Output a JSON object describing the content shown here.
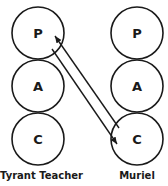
{
  "diagram": {
    "type": "transactional-analysis",
    "states": [
      "P",
      "A",
      "C"
    ],
    "persons": [
      {
        "name": "Tyrant Teacher",
        "states": [
          "P",
          "A",
          "C"
        ]
      },
      {
        "name": "Muriel",
        "states": [
          "P",
          "A",
          "C"
        ]
      }
    ],
    "transactions": [
      {
        "from": "Muriel.C",
        "to": "Tyrant Teacher.P"
      },
      {
        "from": "Tyrant Teacher.P",
        "to": "Muriel.C"
      }
    ],
    "colors": {
      "stroke": "#1a1a1a",
      "background": "#ffffff"
    }
  }
}
